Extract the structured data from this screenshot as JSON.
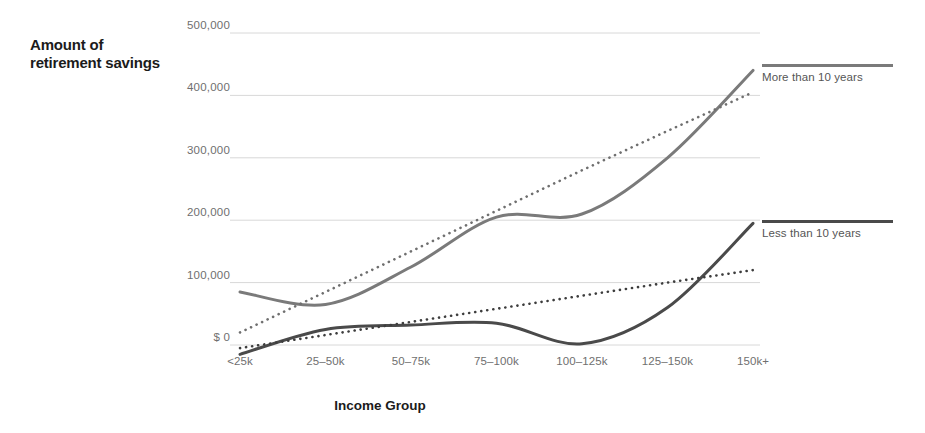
{
  "chart_data": {
    "type": "line",
    "title": "",
    "ylabel": "Amount of retirement savings",
    "xlabel": "Income Group",
    "categories": [
      "<25k",
      "25–50k",
      "50–75k",
      "75–100k",
      "100–125k",
      "125–150k",
      "150k+"
    ],
    "ylim": [
      0,
      500000
    ],
    "yticks": [
      0,
      100000,
      200000,
      300000,
      400000,
      500000
    ],
    "ytick_labels": [
      "$ 0",
      "100,000",
      "200,000",
      "300,000",
      "400,000",
      "500,000"
    ],
    "grid": true,
    "legend_position": "right",
    "series": [
      {
        "name": "More than 10 years",
        "color": "#7a7a7a",
        "style": "solid",
        "values": [
          85000,
          65000,
          125000,
          205000,
          210000,
          300000,
          440000
        ]
      },
      {
        "name": "More than 10 years trend",
        "color": "#6f6f6f",
        "style": "dotted",
        "values": [
          20000,
          85000,
          150000,
          215000,
          280000,
          343000,
          405000
        ]
      },
      {
        "name": "Less than 10 years",
        "color": "#4a4a4a",
        "style": "solid",
        "values": [
          -15000,
          25000,
          32000,
          35000,
          2000,
          60000,
          195000
        ]
      },
      {
        "name": "Less than 10 years trend",
        "color": "#3d3d3d",
        "style": "dotted",
        "values": [
          -5000,
          16000,
          37000,
          58000,
          79000,
          100000,
          120000
        ]
      }
    ]
  },
  "legend": [
    {
      "label": "More than 10 years",
      "color": "#7a7a7a"
    },
    {
      "label": "Less than 10 years",
      "color": "#4a4a4a"
    }
  ],
  "colors": {
    "gridline": "#d8d8d8",
    "tick_text": "#6f6f6f",
    "title_text": "#1b1b1b",
    "series_light": "#7a7a7a",
    "series_dark": "#4a4a4a",
    "background": "#ffffff"
  }
}
